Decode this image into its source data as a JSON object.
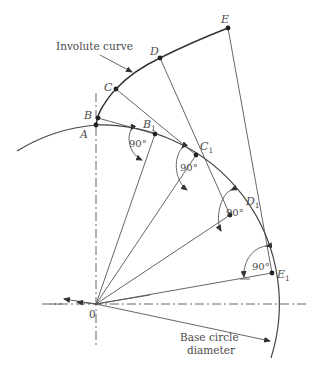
{
  "figure": {
    "title_label": "Involute curve",
    "base_label_line1": "Base circle",
    "base_label_line2": "diameter",
    "origin_label": "0",
    "angle_label": "90°",
    "points": {
      "A": {
        "label": "A"
      },
      "B": {
        "label": "B"
      },
      "C": {
        "label": "C"
      },
      "D": {
        "label": "D"
      },
      "E": {
        "label": "E"
      },
      "B1": {
        "label": "B",
        "sub": "1"
      },
      "C1": {
        "label": "C",
        "sub": "1"
      },
      "D1": {
        "label": "D",
        "sub": "1"
      },
      "E1": {
        "label": "E",
        "sub": "1"
      }
    },
    "colors": {
      "line": "#555555",
      "curve": "#333333",
      "text": "#4a4a4a"
    }
  }
}
